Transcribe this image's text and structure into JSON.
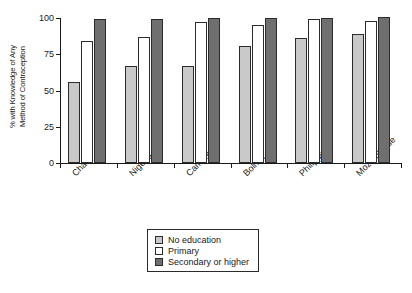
{
  "chart_data": {
    "type": "bar",
    "title": "",
    "xlabel": "",
    "ylabel": "% with Knowledge of Any Method of Contraception",
    "ylabel_line1": "% with Knowledge of Any",
    "ylabel_line2": "Method of Contraception",
    "ylim": [
      0,
      100
    ],
    "yticks": [
      0,
      25,
      50,
      75,
      100
    ],
    "ytick_labels": [
      "0",
      "25",
      "50",
      "75",
      "100"
    ],
    "grid": false,
    "legend_position": "bottom-center",
    "categories": [
      "Chad",
      "Nigeria",
      "Cameroon",
      "Bolivia",
      "Philippines",
      "Mozambique"
    ],
    "series": [
      {
        "name": "No education",
        "color": "#c9c9c9",
        "values": [
          56,
          67,
          67,
          81,
          86,
          89
        ]
      },
      {
        "name": "Primary",
        "color": "#ffffff",
        "values": [
          84,
          87,
          97,
          95,
          99,
          98
        ]
      },
      {
        "name": "Secondary or higher",
        "color": "#6f6f6f",
        "values": [
          99,
          99,
          100,
          100,
          100,
          101
        ]
      }
    ]
  },
  "legend": {
    "items": [
      {
        "label": "No education",
        "swatch": "s0"
      },
      {
        "label": "Primary",
        "swatch": "s1"
      },
      {
        "label": "Secondary or higher",
        "swatch": "s2"
      }
    ]
  },
  "colors": {
    "no_education": "#c9c9c9",
    "primary": "#ffffff",
    "secondary_or_higher": "#6f6f6f",
    "outline": "#2b2b2b",
    "background": "#ffffff"
  }
}
